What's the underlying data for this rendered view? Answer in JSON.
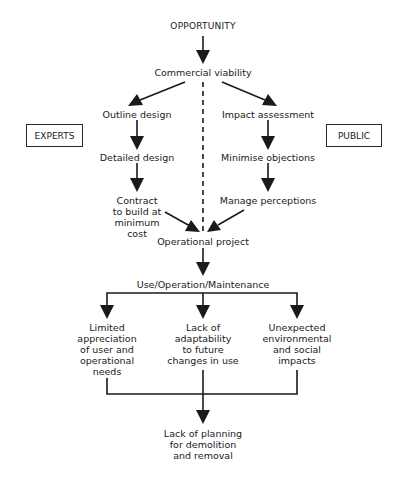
{
  "diagram": {
    "type": "flowchart",
    "nodes": {
      "opportunity": "OPPORTUNITY",
      "commercial_viability": "Commercial viability",
      "outline_design": "Outline design",
      "detailed_design": "Detailed design",
      "contract": "Contract\nto build at\nminimum\ncost",
      "impact_assessment": "Impact assessment",
      "minimise_objections": "Minimise objections",
      "manage_perceptions": "Manage perceptions",
      "operational_project": "Operational project",
      "use_operation_maintenance": "Use/Operation/Maintenance",
      "limited_appreciation": "Limited\nappreciation\nof user and\noperational\nneeds",
      "lack_of_adaptability": "Lack of\nadaptability\nto future\nchanges in use",
      "unexpected_impacts": "Unexpected\nenvironmental\nand social\nimpacts",
      "lack_of_planning": "Lack of planning\nfor demolition\nand removal"
    },
    "side_labels": {
      "experts": "EXPERTS",
      "public": "PUBLIC"
    },
    "edges": [
      {
        "from": "opportunity",
        "to": "commercial_viability",
        "style": "solid"
      },
      {
        "from": "commercial_viability",
        "to": "outline_design",
        "style": "solid"
      },
      {
        "from": "commercial_viability",
        "to": "impact_assessment",
        "style": "solid"
      },
      {
        "from": "commercial_viability",
        "to": "operational_project",
        "style": "dashed"
      },
      {
        "from": "outline_design",
        "to": "detailed_design",
        "style": "solid"
      },
      {
        "from": "detailed_design",
        "to": "contract",
        "style": "solid"
      },
      {
        "from": "contract",
        "to": "operational_project",
        "style": "solid"
      },
      {
        "from": "impact_assessment",
        "to": "minimise_objections",
        "style": "solid"
      },
      {
        "from": "minimise_objections",
        "to": "manage_perceptions",
        "style": "solid"
      },
      {
        "from": "manage_perceptions",
        "to": "operational_project",
        "style": "solid"
      },
      {
        "from": "operational_project",
        "to": "use_operation_maintenance",
        "style": "solid"
      },
      {
        "from": "use_operation_maintenance",
        "to": "limited_appreciation",
        "style": "solid"
      },
      {
        "from": "use_operation_maintenance",
        "to": "lack_of_adaptability",
        "style": "solid"
      },
      {
        "from": "use_operation_maintenance",
        "to": "unexpected_impacts",
        "style": "solid"
      },
      {
        "from": "limited_appreciation",
        "to": "lack_of_planning",
        "style": "merge"
      },
      {
        "from": "lack_of_adaptability",
        "to": "lack_of_planning",
        "style": "merge"
      },
      {
        "from": "unexpected_impacts",
        "to": "lack_of_planning",
        "style": "merge"
      }
    ],
    "colors": {
      "ink": "#1a1a1a",
      "background": "#ffffff"
    }
  }
}
